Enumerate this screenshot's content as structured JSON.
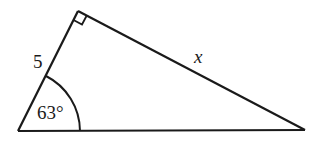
{
  "diagram": {
    "type": "right-triangle",
    "colors": {
      "stroke": "#1a1a1a",
      "background": "#ffffff"
    },
    "vertices": {
      "bottom_left": [
        18,
        131
      ],
      "top": [
        78,
        11
      ],
      "bottom_right": [
        305,
        130
      ]
    },
    "right_angle_at": "top",
    "labels": {
      "side_left": "5",
      "angle_bottom_left": "63°",
      "side_hypotenuse_top": "x"
    }
  }
}
